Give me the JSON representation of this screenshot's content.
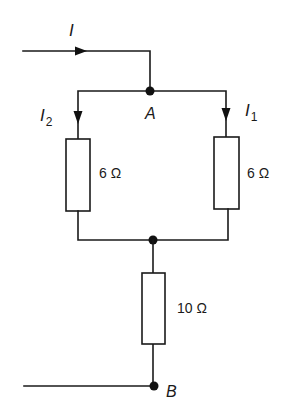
{
  "diagram": {
    "type": "circuit",
    "colors": {
      "line": "#1a1a1a",
      "background": "#ffffff"
    },
    "currents": {
      "input": {
        "symbol": "I",
        "subscript": ""
      },
      "left_branch": {
        "symbol": "I",
        "subscript": "2"
      },
      "right_branch": {
        "symbol": "I",
        "subscript": "1"
      }
    },
    "nodes": {
      "top": "A",
      "bottom": "B"
    },
    "resistors": [
      {
        "id": "left",
        "value": "6 Ω"
      },
      {
        "id": "right",
        "value": "6 Ω"
      },
      {
        "id": "series",
        "value": "10 Ω"
      }
    ]
  }
}
